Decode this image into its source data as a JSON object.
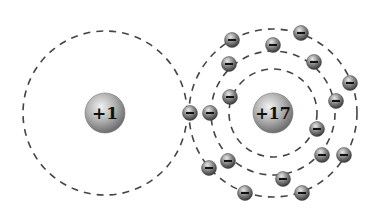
{
  "atoms": [
    {
      "name": "hydrogen",
      "nucleus_label": "+1",
      "cx": 105,
      "cy": 113,
      "nucleus_r": 20,
      "shells": [
        82
      ]
    },
    {
      "name": "chlorine",
      "nucleus_label": "+17",
      "cx": 273,
      "cy": 113,
      "nucleus_r": 20,
      "shells": [
        44,
        62,
        84
      ]
    }
  ],
  "electron_symbol": "−",
  "electrons": {
    "shared": [
      [
        190,
        113
      ],
      [
        210,
        113
      ]
    ],
    "chlorine_inner": [
      [
        230,
        97
      ],
      [
        317,
        129
      ]
    ],
    "chlorine_middle": [
      [
        229,
        64
      ],
      [
        273,
        45
      ],
      [
        314,
        62
      ],
      [
        336,
        101
      ],
      [
        322,
        155
      ],
      [
        228,
        161
      ],
      [
        283,
        179
      ]
    ],
    "chlorine_outer": [
      [
        232,
        40
      ],
      [
        301,
        33
      ],
      [
        350,
        83
      ],
      [
        344,
        155
      ],
      [
        209,
        168
      ],
      [
        245,
        193
      ],
      [
        302,
        193
      ]
    ]
  },
  "colors": {
    "dash": "#444444",
    "nucleus": "#9a9a9a",
    "electron": "#808080"
  }
}
